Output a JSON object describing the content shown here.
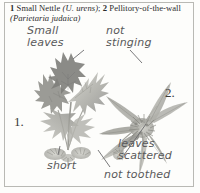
{
  "caption": {
    "num1": "1",
    "name1": "Small Nettle",
    "sci1": "(U. urens)",
    "sep": "; ",
    "num2": "2",
    "name2": "Pellitory-of-the-wall",
    "sci2": "(Parietaria judaica)"
  },
  "plates": {
    "label_1": "1.",
    "label_2": "2."
  },
  "annotations": {
    "small_leaves": "Small\nleaves",
    "not_stinging": "not\nstinging",
    "leaves_scattered": "leaves\nscattered",
    "short": "short",
    "not_toothed": "not toothed"
  },
  "colors": {
    "page_background": "#fdfdfb",
    "rule": "#b9b9b4",
    "caption_text": "#2b2b2b",
    "handwriting": "#59595a",
    "plate_number": "#3a3a38",
    "foliage_dark": "#8d8d88",
    "foliage_mid": "#aaaaa4",
    "foliage_light": "#c9c9c3",
    "stem": "#9b9b95",
    "flower": "#b6b6ae"
  }
}
